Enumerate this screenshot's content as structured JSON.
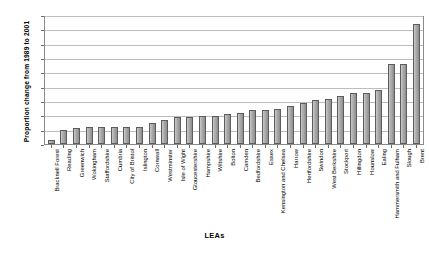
{
  "chart_data": {
    "type": "bar",
    "title": "",
    "xlabel": "LEAs",
    "ylabel": "Proportion change from 1989 to 2001",
    "ylim": [
      0,
      90
    ],
    "ytick_step": 10,
    "yticks": [
      90,
      80,
      70,
      60,
      50,
      40,
      30,
      20,
      10,
      0
    ],
    "grid": true,
    "legend": "none",
    "bar_color": "#a8a8a8",
    "bar_border_color": "#5c5c5c",
    "categories": [
      "Bracknell Forest",
      "Reading",
      "Greenwich",
      "Wokingham",
      "Staffordshire",
      "Cumbria",
      "City of Bristol",
      "Islington",
      "Cornwall",
      "Westminster",
      "Isle of Wight",
      "Gloucestershire",
      "Hampshire",
      "Wiltshire",
      "Bolton",
      "Camden",
      "Bedfordshire",
      "Essex",
      "Kensington and Chelsea",
      "Harrow",
      "Hertfordshire",
      "Swindon",
      "West Berkshire",
      "Stockport",
      "Hillingdon",
      "Hounslow",
      "Ealing",
      "Hammersmith and Fulham",
      "Slough",
      "Brent"
    ],
    "values": [
      3,
      10,
      11,
      12,
      12,
      12,
      12,
      12,
      15,
      17,
      19,
      19,
      20,
      20,
      21,
      22,
      24,
      24,
      25,
      27,
      29,
      31,
      32,
      34,
      36,
      36,
      38,
      57,
      57,
      85
    ]
  }
}
